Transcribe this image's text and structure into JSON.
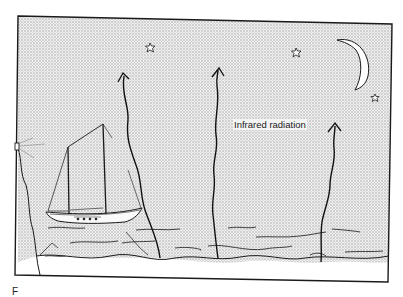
{
  "figure": {
    "label_infrared": "Infrared radiation",
    "caption_fragment": "F",
    "elements": {
      "sky": "night sky (stippled)",
      "moon": "crescent-moon",
      "stars": 3,
      "arrows": 4,
      "sea": "sea with wave lines",
      "boat": "two-masted sailing boat",
      "lighthouse": "lighthouse on cliff (left edge)"
    },
    "colors": {
      "ink": "#1a1a1a",
      "sky": "#d9d9d9",
      "paper": "#ffffff"
    }
  }
}
